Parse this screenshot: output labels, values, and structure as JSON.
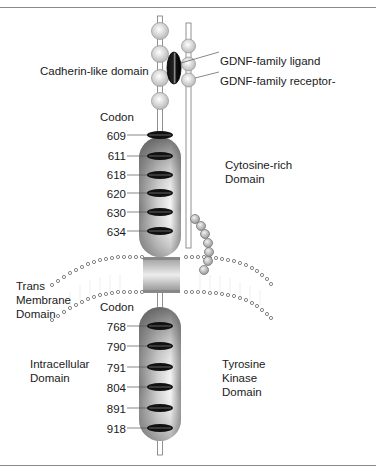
{
  "figure": {
    "labels": {
      "cadherin": "Cadherin-like domain",
      "gdnf_ligand": "GDNF-family ligand",
      "gdnf_receptor": "GDNF-family receptor-",
      "cytosine_rich_1": "Cytosine-rich",
      "cytosine_rich_2": "Domain",
      "trans_1": "Trans",
      "trans_2": "Membrane",
      "trans_3": "Domain",
      "intracellular_1": "Intracellular",
      "intracellular_2": "Domain",
      "tyrosine_1": "Tyrosine",
      "tyrosine_2": "Kinase",
      "tyrosine_3": "Domain"
    },
    "extracellular_codon_header": "Codon",
    "extracellular_codons": [
      "609",
      "611",
      "618",
      "620",
      "630",
      "634"
    ],
    "intracellular_codon_header": "Codon",
    "intracellular_codons": [
      "768",
      "790",
      "791",
      "804",
      "891",
      "918"
    ],
    "colors": {
      "capsule_dark": "#6e6e6e",
      "capsule_light": "#f2f2f2",
      "band": "#111111",
      "bead": "#d8d8d8",
      "rule": "#8a8a8a"
    }
  }
}
